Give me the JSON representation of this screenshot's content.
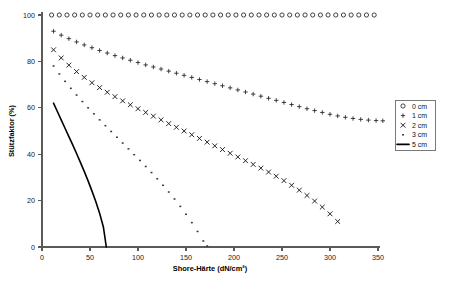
{
  "chart_data": {
    "type": "scatter",
    "title": "",
    "xlabel": "Shore-Härte (dN/cm²)",
    "ylabel": "Stützfaktor (%)",
    "xlim": [
      0,
      350
    ],
    "ylim": [
      0,
      100
    ],
    "xticks": [
      0,
      50,
      100,
      150,
      200,
      250,
      300,
      350
    ],
    "yticks": [
      0,
      20,
      40,
      60,
      80,
      100
    ],
    "grid": false,
    "legend_position": "right",
    "series": [
      {
        "name": "0 cm",
        "marker": "open-circle",
        "x": [
          10,
          18,
          26,
          34,
          42,
          50,
          58,
          66,
          74,
          82,
          90,
          98,
          106,
          114,
          122,
          130,
          138,
          146,
          154,
          162,
          170,
          178,
          186,
          194,
          202,
          210,
          218,
          226,
          234,
          242,
          250,
          258,
          266,
          274,
          282,
          290,
          298,
          306,
          314,
          322,
          330,
          338,
          346
        ],
        "y": [
          100,
          100,
          100,
          100,
          100,
          100,
          100,
          100,
          100,
          100,
          100,
          100,
          100,
          100,
          100,
          100,
          100,
          100,
          100,
          100,
          100,
          100,
          100,
          100,
          100,
          100,
          100,
          100,
          100,
          100,
          100,
          100,
          100,
          100,
          100,
          100,
          100,
          100,
          100,
          100,
          100,
          100,
          100
        ]
      },
      {
        "name": "1 cm",
        "marker": "plus",
        "x": [
          12,
          20,
          28,
          36,
          44,
          52,
          60,
          68,
          76,
          84,
          92,
          100,
          108,
          116,
          124,
          132,
          140,
          148,
          156,
          164,
          172,
          180,
          188,
          196,
          204,
          212,
          220,
          228,
          236,
          244,
          252,
          260,
          268,
          276,
          284,
          292,
          300,
          308,
          316,
          324,
          332,
          340,
          348,
          355
        ],
        "y": [
          93.0,
          91.3,
          89.8,
          88.4,
          87.1,
          85.9,
          84.7,
          83.6,
          82.5,
          81.5,
          80.5,
          79.5,
          78.5,
          77.6,
          76.7,
          75.8,
          74.9,
          74.0,
          73.1,
          72.2,
          71.3,
          70.4,
          69.5,
          68.6,
          67.7,
          66.8,
          65.9,
          65.0,
          64.1,
          63.2,
          62.3,
          61.4,
          60.5,
          59.6,
          58.8,
          58.0,
          57.2,
          56.5,
          55.9,
          55.4,
          55.0,
          54.7,
          54.5,
          54.4
        ]
      },
      {
        "name": "2 cm",
        "marker": "cross",
        "x": [
          12,
          20,
          28,
          36,
          44,
          52,
          60,
          68,
          76,
          84,
          92,
          100,
          108,
          116,
          124,
          132,
          140,
          148,
          156,
          164,
          172,
          180,
          188,
          196,
          204,
          212,
          220,
          228,
          236,
          244,
          252,
          260,
          268,
          276,
          284,
          292,
          300,
          308
        ],
        "y": [
          85.0,
          81.5,
          78.4,
          75.6,
          73.1,
          70.8,
          68.7,
          66.7,
          64.8,
          63.0,
          61.3,
          59.6,
          58.0,
          56.4,
          54.8,
          53.2,
          51.6,
          50.0,
          48.4,
          46.8,
          45.2,
          43.6,
          42.0,
          40.4,
          38.8,
          37.2,
          35.6,
          34.0,
          32.3,
          30.5,
          28.6,
          26.6,
          24.5,
          22.2,
          19.8,
          17.2,
          14.3,
          11.0
        ]
      },
      {
        "name": "3 cm",
        "marker": "dot",
        "x": [
          12,
          18,
          24,
          30,
          36,
          42,
          48,
          54,
          60,
          66,
          72,
          78,
          84,
          90,
          96,
          102,
          108,
          114,
          120,
          126,
          132,
          138,
          144,
          150,
          156,
          162,
          168,
          172
        ],
        "y": [
          78.0,
          74.6,
          71.4,
          68.4,
          65.5,
          62.7,
          60.0,
          57.4,
          54.8,
          52.3,
          49.8,
          47.3,
          44.8,
          42.3,
          39.8,
          37.3,
          34.7,
          32.1,
          29.4,
          26.6,
          23.7,
          20.7,
          17.5,
          14.1,
          10.5,
          6.7,
          2.6,
          0.4
        ]
      },
      {
        "name": "5 cm",
        "marker": "line",
        "x": [
          12,
          16,
          20,
          24,
          28,
          32,
          36,
          40,
          44,
          48,
          52,
          56,
          60,
          64,
          67
        ],
        "y": [
          62.0,
          58.4,
          54.8,
          51.2,
          47.6,
          44.0,
          40.3,
          36.5,
          32.6,
          28.5,
          24.2,
          19.6,
          14.6,
          8.5,
          0.0
        ]
      }
    ]
  },
  "legend": {
    "items": [
      {
        "label": "0 cm",
        "marker": "open-circle"
      },
      {
        "label": "1 cm",
        "marker": "plus"
      },
      {
        "label": "2 cm",
        "marker": "cross"
      },
      {
        "label": "3 cm",
        "marker": "dot"
      },
      {
        "label": "5 cm",
        "marker": "line"
      }
    ]
  }
}
